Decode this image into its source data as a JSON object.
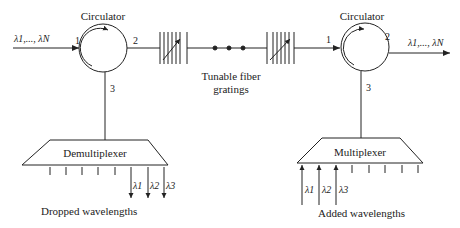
{
  "diagram": {
    "type": "optical add-drop multiplexer",
    "left_circulator": {
      "label": "Circulator",
      "ports": {
        "p1": "1",
        "p2": "2",
        "p3": "3"
      },
      "input_label": "λ1,..., λN"
    },
    "right_circulator": {
      "label": "Circulator",
      "ports": {
        "p1": "1",
        "p2": "2",
        "p3": "3"
      },
      "output_label": "λ1,..., λN"
    },
    "gratings": {
      "label_line1": "Tunable fiber",
      "label_line2": "gratings"
    },
    "demux": {
      "label": "Demultiplexer",
      "outputs": [
        "λ1",
        "λ2",
        "λ3"
      ],
      "caption": "Dropped wavelengths"
    },
    "mux": {
      "label": "Multiplexer",
      "inputs": [
        "λ1",
        "λ2",
        "λ3"
      ],
      "caption": "Added wavelengths"
    },
    "colors": {
      "stroke": "#222222",
      "background": "#ffffff"
    }
  }
}
